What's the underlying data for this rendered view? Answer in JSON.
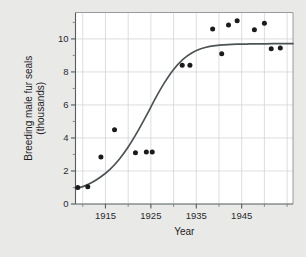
{
  "figure": {
    "top_clipped_text": "",
    "background_color": "#e9e9e7",
    "plot_background_color": "#ffffff"
  },
  "chart_data": {
    "type": "scatter",
    "title": "",
    "xlabel": "Year",
    "ylabel": "Breeding male fur seals (thousands)",
    "ylabel_line1": "Breeding male fur seals",
    "ylabel_line2": "(thousands)",
    "xlim": [
      1908.4,
      1956.3
    ],
    "ylim": [
      0,
      11.6
    ],
    "xticks": [
      1915,
      1925,
      1935,
      1945
    ],
    "xtick_labels": [
      "1915",
      "1925",
      "1935",
      "1945"
    ],
    "xticks_minor": [
      1910,
      1920,
      1930,
      1940,
      1950,
      1955
    ],
    "yticks": [
      0,
      2,
      4,
      6,
      8,
      10
    ],
    "ytick_labels": [
      "0",
      "2",
      "4",
      "6",
      "8",
      "10"
    ],
    "yticks_minor": [
      1,
      3,
      5,
      7,
      9,
      11
    ],
    "grid": true,
    "legend": null,
    "point_color": "#1b1b1d",
    "curve_color": "#4d5355",
    "x": [
      1908.9,
      1911.1,
      1914.0,
      1917.0,
      1921.6,
      1924.0,
      1925.3,
      1931.9,
      1933.6,
      1938.6,
      1940.6,
      1942.1,
      1944.0,
      1947.8,
      1950.0,
      1951.5,
      1953.5
    ],
    "y": [
      1.0,
      1.05,
      2.85,
      4.5,
      3.1,
      3.15,
      3.15,
      8.4,
      8.4,
      10.6,
      9.1,
      10.85,
      11.1,
      10.55,
      10.95,
      9.4,
      9.45
    ],
    "fit": {
      "name": "logistic-growth-curve",
      "curve_x": [
        1908.4,
        1910,
        1912,
        1914,
        1916,
        1918,
        1920,
        1922,
        1924,
        1926,
        1928,
        1930,
        1932,
        1934,
        1936,
        1938,
        1940,
        1942,
        1944,
        1946,
        1948,
        1950,
        1952,
        1954,
        1956.3
      ],
      "curve_y": [
        0.95,
        1.05,
        1.3,
        1.65,
        2.1,
        2.7,
        3.45,
        4.35,
        5.35,
        6.4,
        7.35,
        8.15,
        8.75,
        9.15,
        9.4,
        9.55,
        9.62,
        9.66,
        9.68,
        9.69,
        9.7,
        9.7,
        9.71,
        9.71,
        9.72
      ]
    }
  }
}
